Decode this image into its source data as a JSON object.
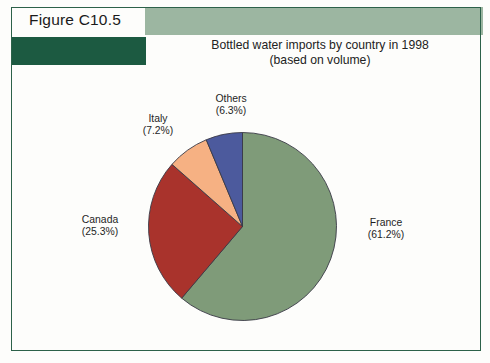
{
  "figure": {
    "number_label": "Figure C10.5"
  },
  "chart_data": {
    "type": "pie",
    "title": "Bottled water imports by country in 1998",
    "subtitle": "(based on volume)",
    "xlabel": "",
    "ylabel": "",
    "units": "percent of volume",
    "legend_position": "callout-labels",
    "grid": false,
    "start_angle_deg": 0,
    "direction": "clockwise",
    "categories": [
      "France",
      "Canada",
      "Italy",
      "Others"
    ],
    "values": [
      61.2,
      25.3,
      7.2,
      6.3
    ],
    "colors": [
      "#7f9b79",
      "#a9332c",
      "#f6b183",
      "#4c5a9d"
    ],
    "slices": [
      {
        "name": "France",
        "value": 61.2,
        "label": "France",
        "pct_label": "(61.2%)",
        "color": "#7f9b79"
      },
      {
        "name": "Canada",
        "value": 25.3,
        "label": "Canada",
        "pct_label": "(25.3%)",
        "color": "#a9332c"
      },
      {
        "name": "Italy",
        "value": 7.2,
        "label": "Italy",
        "pct_label": "(7.2%)",
        "color": "#f6b183"
      },
      {
        "name": "Others",
        "value": 6.3,
        "label": "Others",
        "pct_label": "(6.3%)",
        "color": "#4c5a9d"
      }
    ]
  },
  "theme": {
    "band_color": "#9cb6a1",
    "box_color": "#1c5a41",
    "frame_color": "#2c6149"
  }
}
